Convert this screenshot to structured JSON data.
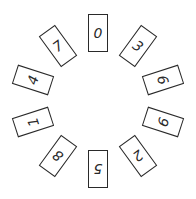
{
  "diagram": {
    "type": "circular-card-arrangement",
    "center": {
      "x": 98,
      "y": 101
    },
    "radius": 68,
    "card_color": "#2a2a2a",
    "background": "#ffffff",
    "cards": [
      {
        "label": "0",
        "angle": 0
      },
      {
        "label": "3",
        "angle": 36
      },
      {
        "label": "6",
        "angle": 72
      },
      {
        "label": "9",
        "angle": 108
      },
      {
        "label": "2",
        "angle": 144
      },
      {
        "label": "5",
        "angle": 180
      },
      {
        "label": "8",
        "angle": 216
      },
      {
        "label": "1",
        "angle": 252
      },
      {
        "label": "4",
        "angle": 288
      },
      {
        "label": "7",
        "angle": 324
      }
    ]
  }
}
